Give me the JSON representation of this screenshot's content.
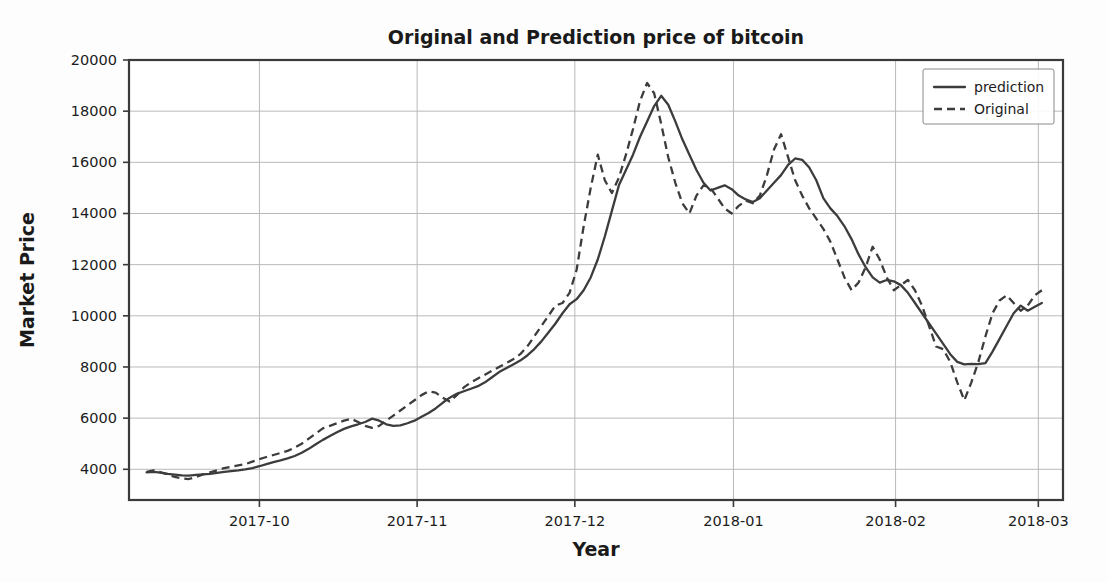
{
  "chart_data": {
    "type": "line",
    "title": "Original and Prediction price of bitcoin",
    "xlabel": "Year",
    "ylabel": "Market Price",
    "grid": true,
    "legend_position": "upper right",
    "ylim": [
      2800,
      20000
    ],
    "yticks": [
      "4000",
      "6000",
      "8000",
      "10000",
      "12000",
      "14000",
      "16000",
      "18000",
      "20000"
    ],
    "ytick_values": [
      4000,
      6000,
      8000,
      10000,
      12000,
      14000,
      16000,
      18000,
      20000
    ],
    "xticks": [
      "2017-10",
      "2017-11",
      "2017-12",
      "2018-01",
      "2018-02",
      "2018-03"
    ],
    "xtick_values": [
      0.148,
      0.327,
      0.506,
      0.686,
      0.87,
      1.032
    ],
    "series": [
      {
        "name": "prediction",
        "style": "solid",
        "color": "#3c3c3c",
        "x": [
          0.02,
          0.028,
          0.036,
          0.044,
          0.052,
          0.06,
          0.068,
          0.076,
          0.084,
          0.092,
          0.1,
          0.108,
          0.116,
          0.124,
          0.132,
          0.14,
          0.148,
          0.156,
          0.164,
          0.172,
          0.18,
          0.188,
          0.196,
          0.204,
          0.212,
          0.22,
          0.228,
          0.236,
          0.244,
          0.252,
          0.26,
          0.268,
          0.276,
          0.284,
          0.292,
          0.3,
          0.308,
          0.316,
          0.324,
          0.332,
          0.34,
          0.348,
          0.356,
          0.364,
          0.372,
          0.38,
          0.388,
          0.396,
          0.404,
          0.412,
          0.42,
          0.428,
          0.436,
          0.444,
          0.452,
          0.46,
          0.468,
          0.476,
          0.484,
          0.492,
          0.5,
          0.508,
          0.516,
          0.524,
          0.532,
          0.54,
          0.548,
          0.556,
          0.564,
          0.572,
          0.58,
          0.588,
          0.596,
          0.604,
          0.612,
          0.62,
          0.628,
          0.636,
          0.644,
          0.652,
          0.66,
          0.668,
          0.676,
          0.684,
          0.692,
          0.7,
          0.708,
          0.716,
          0.724,
          0.732,
          0.74,
          0.748,
          0.756,
          0.764,
          0.772,
          0.78,
          0.788,
          0.796,
          0.804,
          0.812,
          0.82,
          0.828,
          0.836,
          0.844,
          0.852,
          0.86,
          0.868,
          0.876,
          0.884,
          0.892,
          0.9,
          0.908,
          0.916,
          0.924,
          0.932,
          0.94,
          0.948,
          0.956,
          0.964,
          0.972,
          0.98,
          0.988,
          0.996,
          1.004,
          1.012,
          1.02,
          1.028,
          1.036
        ],
        "y": [
          3880,
          3900,
          3870,
          3820,
          3790,
          3760,
          3750,
          3780,
          3800,
          3820,
          3860,
          3900,
          3930,
          3960,
          4000,
          4050,
          4120,
          4200,
          4280,
          4350,
          4430,
          4520,
          4650,
          4800,
          4980,
          5150,
          5300,
          5450,
          5580,
          5680,
          5760,
          5850,
          5980,
          5900,
          5760,
          5700,
          5720,
          5800,
          5900,
          6050,
          6200,
          6380,
          6600,
          6800,
          6950,
          7050,
          7150,
          7250,
          7400,
          7600,
          7800,
          7950,
          8100,
          8250,
          8450,
          8700,
          9000,
          9350,
          9700,
          10100,
          10450,
          10650,
          11000,
          11500,
          12200,
          13100,
          14100,
          15100,
          15700,
          16300,
          17000,
          17600,
          18200,
          18600,
          18250,
          17600,
          16900,
          16300,
          15700,
          15200,
          14900,
          15000,
          15100,
          14950,
          14700,
          14550,
          14450,
          14600,
          14900,
          15200,
          15500,
          15900,
          16150,
          16100,
          15800,
          15300,
          14600,
          14200,
          13900,
          13500,
          13000,
          12400,
          11900,
          11500,
          11300,
          11400,
          11350,
          11200,
          10900,
          10500,
          10100,
          9700,
          9300,
          8900,
          8500,
          8200,
          8100,
          8120,
          8110,
          8150,
          8600,
          9100,
          9600,
          10100,
          10400,
          10200,
          10350,
          10500
        ],
        "notable": {
          "start": 3880,
          "peak": 18600,
          "trough_after_peak": 8100,
          "end": 10500
        }
      },
      {
        "name": "Original",
        "style": "dashed",
        "color": "#3c3c3c",
        "x": [
          0.02,
          0.028,
          0.036,
          0.044,
          0.052,
          0.06,
          0.068,
          0.076,
          0.084,
          0.092,
          0.1,
          0.108,
          0.116,
          0.124,
          0.132,
          0.14,
          0.148,
          0.156,
          0.164,
          0.172,
          0.18,
          0.188,
          0.196,
          0.204,
          0.212,
          0.22,
          0.228,
          0.236,
          0.244,
          0.252,
          0.26,
          0.268,
          0.276,
          0.284,
          0.292,
          0.3,
          0.308,
          0.316,
          0.324,
          0.332,
          0.34,
          0.348,
          0.356,
          0.364,
          0.372,
          0.38,
          0.388,
          0.396,
          0.404,
          0.412,
          0.42,
          0.428,
          0.436,
          0.444,
          0.452,
          0.46,
          0.468,
          0.476,
          0.484,
          0.492,
          0.5,
          0.508,
          0.516,
          0.524,
          0.532,
          0.54,
          0.548,
          0.556,
          0.564,
          0.572,
          0.58,
          0.588,
          0.596,
          0.604,
          0.612,
          0.62,
          0.628,
          0.636,
          0.644,
          0.652,
          0.66,
          0.668,
          0.676,
          0.684,
          0.692,
          0.7,
          0.708,
          0.716,
          0.724,
          0.732,
          0.74,
          0.748,
          0.756,
          0.764,
          0.772,
          0.78,
          0.788,
          0.796,
          0.804,
          0.812,
          0.82,
          0.828,
          0.836,
          0.844,
          0.852,
          0.86,
          0.868,
          0.876,
          0.884,
          0.892,
          0.9,
          0.908,
          0.916,
          0.924,
          0.932,
          0.94,
          0.948,
          0.956,
          0.964,
          0.972,
          0.98,
          0.988,
          0.996,
          1.004,
          1.012,
          1.02,
          1.028,
          1.036
        ],
        "y": [
          3900,
          3960,
          3880,
          3800,
          3700,
          3650,
          3620,
          3700,
          3800,
          3880,
          3960,
          4050,
          4100,
          4150,
          4200,
          4300,
          4400,
          4480,
          4560,
          4640,
          4720,
          4850,
          5000,
          5200,
          5400,
          5600,
          5700,
          5800,
          5900,
          5980,
          5850,
          5700,
          5620,
          5700,
          5900,
          6100,
          6300,
          6500,
          6700,
          6900,
          7050,
          7000,
          6800,
          6650,
          6900,
          7200,
          7400,
          7550,
          7700,
          7850,
          8000,
          8150,
          8300,
          8500,
          8800,
          9200,
          9600,
          10000,
          10400,
          10500,
          10900,
          11800,
          13500,
          15000,
          16300,
          15300,
          14800,
          15400,
          16300,
          17300,
          18400,
          19100,
          18700,
          17500,
          16200,
          15200,
          14400,
          14000,
          14700,
          15100,
          15000,
          14600,
          14200,
          14000,
          14300,
          14500,
          14400,
          14700,
          15500,
          16500,
          17100,
          16200,
          15300,
          14700,
          14200,
          13800,
          13400,
          12900,
          12200,
          11500,
          11000,
          11300,
          11900,
          12700,
          12200,
          11500,
          11000,
          11200,
          11400,
          11000,
          10400,
          9600,
          8800,
          8700,
          8200,
          7400,
          6700,
          7400,
          8200,
          9200,
          10100,
          10600,
          10800,
          10500,
          10200,
          10400,
          10800,
          11000
        ],
        "notable": {
          "start": 3900,
          "peak": 19100,
          "trough_after_peak": 6700,
          "end": 11000
        }
      }
    ]
  },
  "legend": {
    "entries": [
      {
        "label": "prediction",
        "style": "solid"
      },
      {
        "label": "Original",
        "style": "dashed"
      }
    ]
  }
}
